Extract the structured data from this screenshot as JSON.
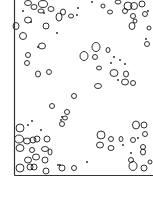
{
  "figure": {
    "stroke_color": "#1a1a1a",
    "background": "#ffffff",
    "frame": {
      "left_x": 14.5,
      "top_y": 0,
      "bottom_y": 175.5,
      "right_x": 153
    },
    "ellipses": [
      [
        28,
        3,
        3.5,
        2.5
      ],
      [
        34,
        7,
        3,
        2.5
      ],
      [
        43,
        4,
        4.5,
        3.5
      ],
      [
        41,
        11,
        3,
        2
      ],
      [
        51,
        9,
        3,
        2.5
      ],
      [
        59,
        17,
        3,
        4
      ],
      [
        63,
        12,
        2.5,
        3
      ],
      [
        71,
        16,
        2.5,
        2
      ],
      [
        28,
        20,
        3.5,
        3
      ],
      [
        16,
        26,
        3,
        3.5
      ],
      [
        46,
        26,
        3,
        3
      ],
      [
        23,
        36,
        3.5,
        3.5
      ],
      [
        42,
        46,
        3.5,
        3
      ],
      [
        28,
        55,
        2.5,
        2.5
      ],
      [
        27,
        63,
        2.5,
        2.5
      ],
      [
        38,
        74,
        2.5,
        3
      ],
      [
        49,
        72,
        2.5,
        2.5
      ],
      [
        103,
        6,
        2,
        2
      ],
      [
        110,
        12,
        2.5,
        2
      ],
      [
        118,
        2,
        3,
        2
      ],
      [
        128,
        6,
        4,
        4
      ],
      [
        134,
        6,
        3.5,
        3.5
      ],
      [
        142,
        4,
        3,
        3
      ],
      [
        125,
        11,
        2.5,
        2.5
      ],
      [
        133,
        16,
        2.5,
        2.5
      ],
      [
        135,
        21,
        2,
        2
      ],
      [
        145,
        14,
        2.5,
        2.5
      ],
      [
        132,
        26,
        3,
        3.5
      ],
      [
        149,
        28,
        2,
        2
      ],
      [
        147,
        44,
        2.5,
        2.5
      ],
      [
        96,
        47,
        4,
        4.5
      ],
      [
        84,
        56,
        4,
        4.5
      ],
      [
        95,
        57,
        2.5,
        2.5
      ],
      [
        108,
        50,
        2,
        2.5
      ],
      [
        99,
        68,
        2.5,
        2
      ],
      [
        114,
        73,
        4,
        3.5
      ],
      [
        126,
        74,
        2.5,
        3
      ],
      [
        125,
        82,
        3.5,
        3
      ],
      [
        133,
        83,
        2.5,
        2.5
      ],
      [
        98,
        86,
        3.5,
        2.5
      ],
      [
        74,
        96,
        2.5,
        2.5
      ],
      [
        52,
        106,
        2.5,
        2.5
      ],
      [
        67,
        112,
        2.5,
        2.5
      ],
      [
        65,
        118,
        2.5,
        2
      ],
      [
        62,
        124,
        2.5,
        2.5
      ],
      [
        20,
        128,
        4,
        4
      ],
      [
        19,
        139,
        4.5,
        4
      ],
      [
        27,
        141,
        3.5,
        3
      ],
      [
        33,
        140,
        3,
        3
      ],
      [
        37,
        139,
        3,
        3
      ],
      [
        47,
        139,
        3,
        3
      ],
      [
        20,
        148,
        4,
        3.5
      ],
      [
        32,
        150,
        2.5,
        2.5
      ],
      [
        45,
        149,
        3.5,
        2.5
      ],
      [
        50,
        152,
        2,
        3
      ],
      [
        28,
        160,
        3.5,
        3
      ],
      [
        36,
        157,
        3.5,
        3
      ],
      [
        45,
        160,
        3,
        3
      ],
      [
        34,
        167,
        3,
        3
      ],
      [
        20,
        168,
        4,
        4
      ],
      [
        30,
        167,
        3,
        3
      ],
      [
        46,
        171,
        3,
        3
      ],
      [
        62,
        168,
        3,
        3
      ],
      [
        74,
        168,
        2.5,
        2.5
      ],
      [
        101,
        135,
        4,
        4
      ],
      [
        111,
        139,
        2.5,
        2.5
      ],
      [
        100,
        145,
        3.5,
        3
      ],
      [
        111,
        148,
        3,
        2.5
      ],
      [
        121,
        139,
        2,
        2.5
      ],
      [
        133,
        140,
        2.5,
        2.5
      ],
      [
        136,
        125,
        3.5,
        4
      ],
      [
        144,
        125,
        3,
        3
      ],
      [
        145,
        134,
        2.5,
        2.5
      ],
      [
        143,
        147,
        2.5,
        2.5
      ],
      [
        143,
        152,
        2.5,
        3
      ],
      [
        131,
        160,
        2.5,
        2.5
      ],
      [
        133,
        166,
        4,
        4.5
      ],
      [
        144,
        168,
        3,
        3
      ],
      [
        150,
        162,
        2,
        2
      ]
    ],
    "dots": [
      [
        23,
        11
      ],
      [
        44,
        13
      ],
      [
        57,
        33
      ],
      [
        38,
        47
      ],
      [
        78,
        8
      ],
      [
        92,
        2
      ],
      [
        148,
        11
      ],
      [
        146,
        39
      ],
      [
        114,
        57
      ],
      [
        120,
        60
      ],
      [
        125,
        64
      ],
      [
        111,
        63
      ],
      [
        118,
        80
      ],
      [
        31,
        22
      ],
      [
        77,
        15
      ],
      [
        32,
        121
      ],
      [
        28,
        125
      ],
      [
        41,
        130
      ],
      [
        62,
        117
      ],
      [
        61,
        120
      ],
      [
        58,
        165
      ],
      [
        60,
        165
      ],
      [
        87,
        162
      ],
      [
        123,
        145
      ],
      [
        138,
        138
      ],
      [
        131,
        153
      ]
    ]
  }
}
